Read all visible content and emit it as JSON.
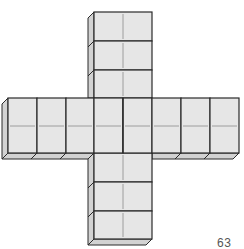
{
  "figure": {
    "page_number": "63",
    "colors": {
      "face": "#e6e6e6",
      "side": "#d2d2d2",
      "edge": "#2a2a2a",
      "inner_line": "#8a8a8a",
      "background": "#ffffff"
    },
    "vertical_column": {
      "x_left": 94,
      "x_right": 152,
      "top_cells": [
        [
          12,
          41
        ],
        [
          41,
          70
        ],
        [
          70,
          98
        ]
      ],
      "bottom_cells": [
        [
          153,
          182
        ],
        [
          182,
          211
        ],
        [
          211,
          239
        ]
      ]
    },
    "horizontal_row": {
      "y_top": 98,
      "y_bottom": 153,
      "y_mid": 126,
      "cell_edges": [
        8,
        37,
        66,
        94,
        123,
        152,
        181,
        210,
        239
      ]
    },
    "depth": 6
  }
}
